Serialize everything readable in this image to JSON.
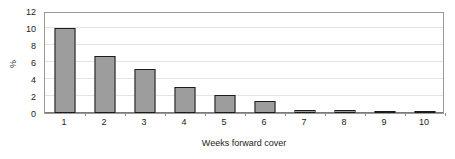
{
  "chart_data": {
    "type": "bar",
    "title": "",
    "subtitle": "",
    "xlabel": "Weeks forward cover",
    "ylabel": "%",
    "categories": [
      "1",
      "2",
      "3",
      "4",
      "5",
      "6",
      "7",
      "8",
      "9",
      "10"
    ],
    "values": [
      9.95,
      6.75,
      5.2,
      3.05,
      2.1,
      1.45,
      0.4,
      0.3,
      0.25,
      0.1
    ],
    "series": [
      {
        "name": "",
        "values": [
          9.95,
          6.75,
          5.2,
          3.05,
          2.1,
          1.45,
          0.4,
          0.3,
          0.25,
          0.1
        ]
      }
    ],
    "ylim": [
      0,
      12
    ],
    "ytick_labels": [
      "0",
      "2",
      "4",
      "6",
      "8",
      "10",
      "12"
    ],
    "ytick_values": [
      0,
      2,
      4,
      6,
      8,
      10,
      12
    ],
    "xtick_labels": [
      "1",
      "2",
      "3",
      "4",
      "5",
      "6",
      "7",
      "8",
      "9",
      "10"
    ],
    "grid": "horizontal",
    "legend": "none",
    "colors": {
      "bar_fill": "#9d9d9d",
      "bar_border": "#1c1c1c",
      "gridline": "#e4e4e4",
      "axis_line": "#9a9a9a",
      "baseline": "#7a7a7a",
      "background": "#ffffff",
      "text": "#222222"
    }
  }
}
